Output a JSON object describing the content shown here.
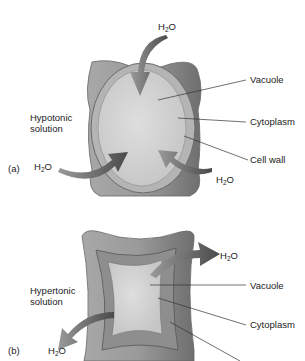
{
  "panel_a": {
    "tag": "(a)",
    "solution_line1": "Hypotonic",
    "solution_line2": "solution",
    "water_top": {
      "pre": "H",
      "sub": "2",
      "post": "O"
    },
    "water_left": {
      "pre": "H",
      "sub": "2",
      "post": "O"
    },
    "water_right": {
      "pre": "H",
      "sub": "2",
      "post": "O"
    },
    "labels": {
      "vacuole": "Vacuole",
      "cytoplasm": "Cytoplasm",
      "cell_wall": "Cell wall"
    }
  },
  "panel_b": {
    "tag": "(b)",
    "solution_line1": "Hypertonic",
    "solution_line2": "solution",
    "water_right": {
      "pre": "H",
      "sub": "2",
      "post": "O"
    },
    "water_left": {
      "pre": "H",
      "sub": "2",
      "post": "O"
    },
    "labels": {
      "vacuole": "Vacuole",
      "cytoplasm": "Cytoplasm"
    }
  },
  "colors": {
    "wall": "#9a9a9a",
    "wall_dark": "#6e6e6e",
    "cytoplasm": "#b5b5b5",
    "vacuole": "#d6d6d6",
    "arrow": "#5a5a5a",
    "leader": "#333333"
  }
}
